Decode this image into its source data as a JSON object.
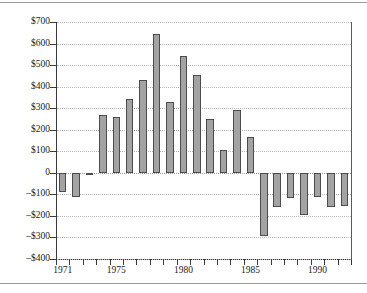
{
  "chart_data": {
    "type": "bar",
    "title": "",
    "subtitle": "",
    "xlabel": "",
    "ylabel": "",
    "categories": [
      "1971",
      "1972",
      "1973",
      "1974",
      "1975",
      "1976",
      "1977",
      "1978",
      "1979",
      "1980",
      "1981",
      "1982",
      "1983",
      "1984",
      "1985",
      "1986",
      "1987",
      "1988",
      "1989",
      "1990",
      "1991",
      "1992"
    ],
    "values": [
      -90,
      -110,
      -10,
      268,
      260,
      342,
      430,
      645,
      330,
      542,
      455,
      250,
      108,
      290,
      165,
      -295,
      -160,
      -115,
      -195,
      -110,
      -160,
      -153
    ],
    "series": [
      {
        "name": "",
        "values": [
          -90,
          -110,
          -10,
          268,
          260,
          342,
          430,
          645,
          330,
          542,
          455,
          250,
          108,
          290,
          165,
          -295,
          -160,
          -115,
          -195,
          -110,
          -160,
          -153
        ]
      }
    ],
    "ylim": [
      -400,
      700
    ],
    "xlim": [
      1970.5,
      1992.5
    ],
    "ytick_values": [
      700,
      600,
      500,
      400,
      300,
      200,
      100,
      0,
      -100,
      -200,
      -300,
      -400
    ],
    "ytick_labels": [
      "$700",
      "$600",
      "$500",
      "$400",
      "$300",
      "$200",
      "$100",
      "0",
      "–$100",
      "–$200",
      "–$300",
      "–$400"
    ],
    "xtick_values": [
      1971,
      1972,
      1973,
      1974,
      1975,
      1976,
      1977,
      1978,
      1979,
      1980,
      1981,
      1982,
      1983,
      1984,
      1985,
      1986,
      1987,
      1988,
      1989,
      1990,
      1991,
      1992
    ],
    "xtick_labels_shown": [
      {
        "value": 1971,
        "label": "1971"
      },
      {
        "value": 1975,
        "label": "1975"
      },
      {
        "value": 1980,
        "label": "1980"
      },
      {
        "value": 1985,
        "label": "1985"
      },
      {
        "value": 1990,
        "label": "1990"
      }
    ],
    "grid": true,
    "grid_axis": "y",
    "legend": null,
    "legend_position": "none",
    "bar_color": "#a3a3a3",
    "bar_edge_color": "#4c4c4c",
    "grid_color": "#b8b8b8",
    "axis_color": "#3a3a3a",
    "background_color": "#ffffff",
    "annotations": []
  }
}
